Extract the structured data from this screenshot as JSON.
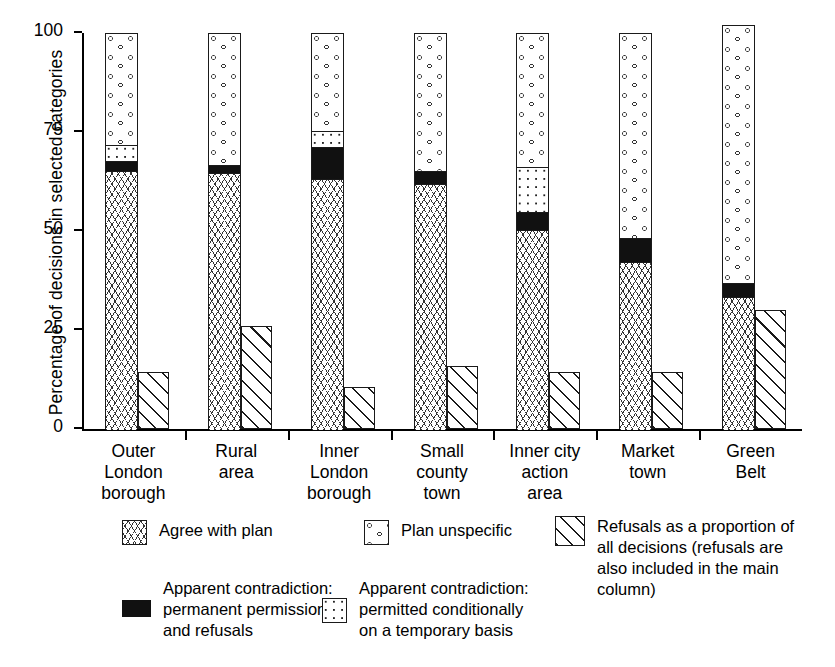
{
  "chart_data": {
    "type": "bar",
    "title": "",
    "xlabel": "",
    "ylabel": "Percentage of decisions in selected categories",
    "ylim": [
      0,
      100
    ],
    "yticks": [
      0,
      25,
      50,
      75,
      100
    ],
    "ytick_labels": [
      "0",
      "25",
      "50",
      "75",
      "100"
    ],
    "grid": false,
    "legend_position": "below-plot",
    "stacked": true,
    "note": "Each category has a stacked main column plus a separate adjacent hatched refusals column. Refusals are also included in the main column.",
    "categories": [
      "Outer London borough",
      "Rural area",
      "Inner London borough",
      "Small county town",
      "Inner city action area",
      "Market town",
      "Green Belt"
    ],
    "category_lines": [
      [
        "Outer",
        "London",
        "borough"
      ],
      [
        "Rural",
        "area"
      ],
      [
        "Inner",
        "London",
        "borough"
      ],
      [
        "Small",
        "county",
        "town"
      ],
      [
        "Inner city",
        "action",
        "area"
      ],
      [
        "Market",
        "town"
      ],
      [
        "Green",
        "Belt"
      ]
    ],
    "series": [
      {
        "name": "Agree with plan",
        "key": "agree",
        "pattern": "arrows",
        "values": [
          65.5,
          65.0,
          63.5,
          62.0,
          50.5,
          42.5,
          33.5
        ]
      },
      {
        "name": "Apparent contradiction: permanent permissions and refusals",
        "key": "black",
        "pattern": "solid-black",
        "values": [
          2.5,
          2.0,
          8.0,
          3.5,
          4.5,
          6.0,
          3.5
        ]
      },
      {
        "name": "Apparent contradiction: permitted conditionally on a temporary basis",
        "key": "dots",
        "pattern": "fine-dots",
        "values": [
          4.0,
          0.0,
          4.0,
          0.0,
          11.5,
          0.0,
          0.0
        ]
      },
      {
        "name": "Plan unspecific",
        "key": "unspecific",
        "pattern": "open-circles",
        "values": [
          28.0,
          33.0,
          24.5,
          34.5,
          33.5,
          51.5,
          65.0
        ]
      }
    ],
    "main_column_totals": [
      100,
      100,
      100,
      100,
      100,
      100,
      102
    ],
    "refusals": {
      "name": "Refusals as a proportion of all decisions (refusals are also included in the main column)",
      "pattern": "diagonal-hatch",
      "values": [
        14.5,
        26.0,
        10.5,
        16.0,
        14.5,
        14.5,
        30.0
      ]
    }
  },
  "legend": {
    "items": [
      {
        "label": "Agree with plan",
        "swatch": "arrows"
      },
      {
        "label": "Plan unspecific",
        "swatch": "open-circles"
      },
      {
        "label": "Refusals as a proportion of\nall decisions (refusals are\nalso included in the main\ncolumn)",
        "swatch": "diagonal-hatch"
      },
      {
        "label": "Apparent contradiction:\npermanent permissions\nand refusals",
        "swatch": "solid-black"
      },
      {
        "label": "Apparent contradiction:\npermitted conditionally\non a temporary basis",
        "swatch": "fine-dots"
      }
    ]
  }
}
